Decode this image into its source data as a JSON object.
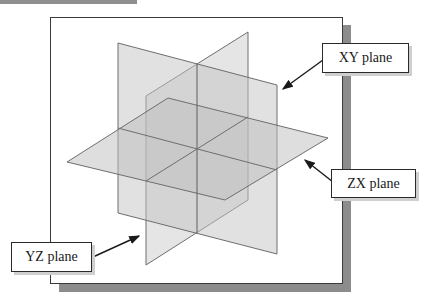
{
  "diagram": {
    "type": "3d-coordinate-planes",
    "planes": [
      {
        "id": "xy",
        "label": "XY plane",
        "orientation": "vertical, facing viewer-right"
      },
      {
        "id": "yz",
        "label": "YZ plane",
        "orientation": "vertical, receding diagonally"
      },
      {
        "id": "zx",
        "label": "ZX plane",
        "orientation": "horizontal"
      }
    ],
    "colors": {
      "plane_fill": "#c8c8c8",
      "plane_edge": "#6e6e6e",
      "frame_border": "#3a3a3a",
      "frame_shadow": "#8c8c8c",
      "arrow": "#1a1a1a",
      "background": "#ffffff"
    }
  },
  "labels": {
    "xy": "XY plane",
    "zx": "ZX plane",
    "yz": "YZ plane"
  }
}
